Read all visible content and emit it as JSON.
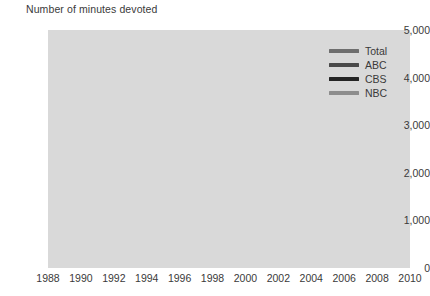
{
  "chart_data": {
    "type": "line",
    "title": "Number of minutes devoted",
    "xlabel": "",
    "ylabel": "",
    "xlim": [
      1988,
      2010
    ],
    "ylim": [
      0,
      5000
    ],
    "grid": true,
    "legend_position": "top-right",
    "y_ticks": [
      0,
      1000,
      2000,
      3000,
      4000,
      5000
    ],
    "y_tick_labels": [
      "0",
      "1,000",
      "2,000",
      "3,000",
      "4,000",
      "5,000"
    ],
    "x_ticks": [
      1988,
      1990,
      1992,
      1994,
      1996,
      1998,
      2000,
      2002,
      2004,
      2006,
      2008,
      2010
    ],
    "x_tick_labels": [
      "1988",
      "1990",
      "1992",
      "1994",
      "1996",
      "1998",
      "2000",
      "2002",
      "2004",
      "2006",
      "2008",
      "2010"
    ],
    "x": [
      1988,
      1989,
      1990,
      1991,
      1992,
      1993,
      1994,
      1995,
      1996,
      1997,
      1998,
      1999,
      2000,
      2001,
      2002,
      2003,
      2004,
      2005,
      2006,
      2007,
      2008,
      2009,
      2010
    ],
    "series": [
      {
        "name": "Total",
        "color": "#6e6e6e",
        "values": [
          3350,
          4020,
          3870,
          3760,
          2970,
          2340,
          2670,
          2060,
          1610,
          1700,
          1530,
          1760,
          1440,
          1840,
          2200,
          2700,
          2480,
          2380,
          2150,
          1820,
          1410,
          1660,
          1900
        ]
      },
      {
        "name": "ABC",
        "color": "#4a4a4a",
        "values": [
          1080,
          1340,
          1300,
          1380,
          1310,
          1000,
          920,
          730,
          700,
          680,
          620,
          690,
          560,
          700,
          800,
          910,
          840,
          800,
          730,
          620,
          470,
          560,
          640
        ]
      },
      {
        "name": "CBS",
        "color": "#242424",
        "values": [
          1150,
          1380,
          1310,
          1350,
          1300,
          870,
          730,
          720,
          700,
          660,
          640,
          690,
          560,
          680,
          800,
          940,
          880,
          830,
          780,
          650,
          460,
          540,
          600
        ]
      },
      {
        "name": "NBC",
        "color": "#8d8d8d",
        "values": [
          1070,
          1270,
          1170,
          1290,
          1200,
          880,
          700,
          600,
          500,
          450,
          430,
          530,
          430,
          520,
          640,
          790,
          760,
          740,
          660,
          540,
          420,
          540,
          610
        ]
      }
    ]
  }
}
